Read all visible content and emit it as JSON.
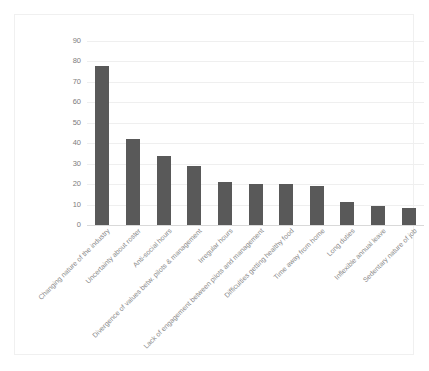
{
  "chart_data": {
    "type": "bar",
    "title": "",
    "subtitle": "",
    "xlabel": "",
    "ylabel": "",
    "ylim": [
      0,
      90
    ],
    "ytick_step": 10,
    "yticks": [
      0,
      10,
      20,
      30,
      40,
      50,
      60,
      70,
      80,
      90
    ],
    "grid": true,
    "legend": false,
    "legend_position": "none",
    "bar_color": "#595959",
    "gridline_color": "#efefef",
    "axis_color": "#d9d9d9",
    "tick_label_color": "#7d7d7d",
    "xlabel_rotation_degrees": -45,
    "categories": [
      "Changing nature of the industry",
      "Uncertainty about roster",
      "Anti-social hours",
      "Divergence of values betw. pilots & management",
      "Irregular hours",
      "Lack of engagement between pilots and management",
      "Difficulties getting healthy food",
      "Time away from home",
      "Long duties",
      "Inflexible annual leave",
      "Sedentary nature of job"
    ],
    "values": [
      78,
      42,
      34,
      29,
      21,
      20,
      20,
      19,
      11.5,
      9.5,
      8.5
    ]
  }
}
